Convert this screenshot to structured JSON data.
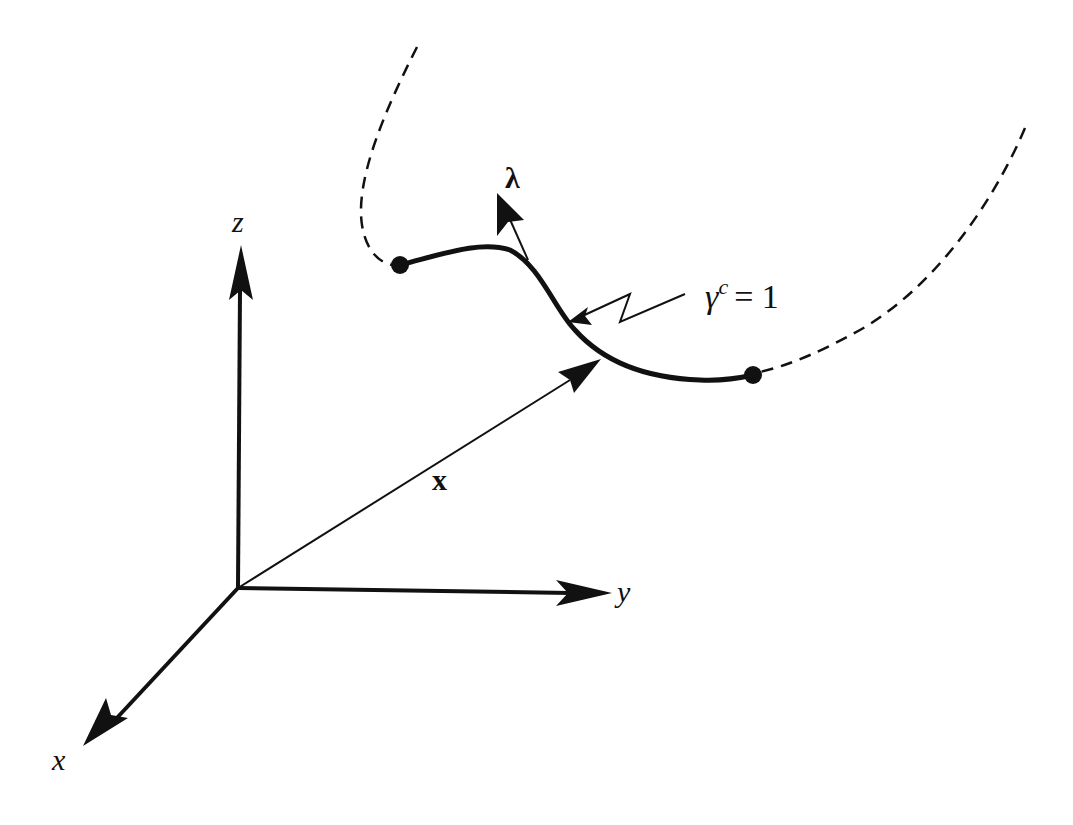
{
  "diagram": {
    "type": "3D coordinate system with a constrained curve segment",
    "colors": {
      "ink": "#111111",
      "background": "#ffffff"
    },
    "axes": {
      "z": {
        "label": "z"
      },
      "y": {
        "label": "y"
      },
      "x": {
        "label": "x"
      }
    },
    "position_vector": {
      "label": "x"
    },
    "tangent_vector": {
      "label": "λ"
    },
    "curve": {
      "annotation": {
        "symbol": "γ",
        "superscript": "c",
        "rhs": "= 1"
      }
    }
  }
}
